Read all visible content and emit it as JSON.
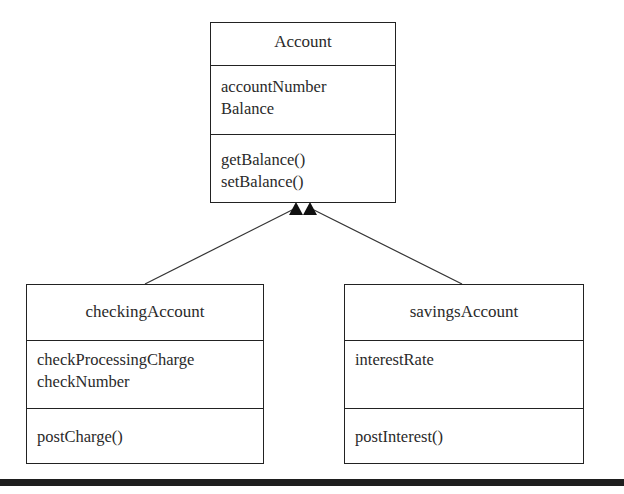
{
  "diagram": {
    "type": "uml-class-diagram",
    "classes": [
      {
        "name": "Account",
        "attributes": [
          "accountNumber",
          "Balance"
        ],
        "methods": [
          "getBalance()",
          "setBalance()"
        ]
      },
      {
        "name": "checkingAccount",
        "attributes": [
          "checkProcessingCharge",
          "checkNumber"
        ],
        "methods": [
          "postCharge()"
        ]
      },
      {
        "name": "savingsAccount",
        "attributes": [
          "interestRate"
        ],
        "methods": [
          "postInterest()"
        ]
      }
    ],
    "relationships": [
      {
        "from": "checkingAccount",
        "to": "Account",
        "type": "inheritance"
      },
      {
        "from": "savingsAccount",
        "to": "Account",
        "type": "inheritance"
      }
    ]
  }
}
